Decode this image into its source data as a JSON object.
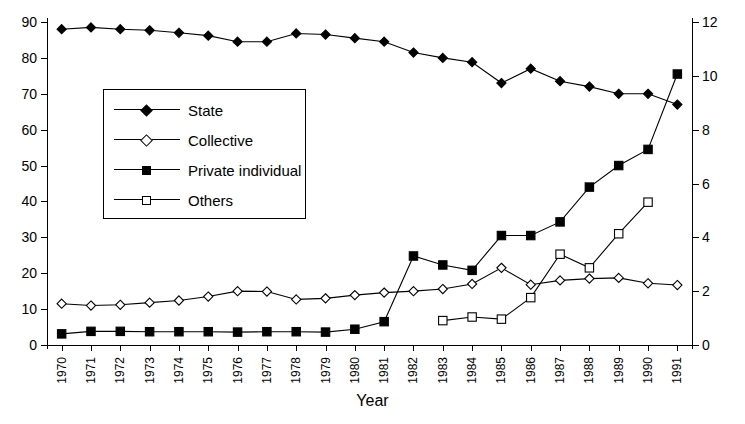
{
  "chart_data": {
    "type": "line",
    "title": "",
    "xlabel": "Year",
    "ylabel": "",
    "ylabel_right": "",
    "grid": false,
    "legend_position": "upper-left-inset",
    "x": [
      1970,
      1971,
      1972,
      1973,
      1974,
      1975,
      1976,
      1977,
      1978,
      1979,
      1980,
      1981,
      1982,
      1983,
      1984,
      1985,
      1986,
      1987,
      1988,
      1989,
      1990,
      1991
    ],
    "categories": [
      "1970",
      "1971",
      "1972",
      "1973",
      "1974",
      "1975",
      "1976",
      "1977",
      "1978",
      "1979",
      "1980",
      "1981",
      "1982",
      "1983",
      "1984",
      "1985",
      "1986",
      "1987",
      "1988",
      "1989",
      "1990",
      "1991"
    ],
    "ylim": [
      0,
      90
    ],
    "yticks": [
      0,
      10,
      20,
      30,
      40,
      50,
      60,
      70,
      80,
      90
    ],
    "ylim_right": [
      0,
      12
    ],
    "yticks_right": [
      0,
      2,
      4,
      6,
      8,
      10,
      12
    ],
    "series": [
      {
        "name": "State",
        "marker": "diamond-filled",
        "axis": "left",
        "values": [
          88.0,
          88.5,
          88.0,
          87.7,
          87.0,
          86.2,
          84.5,
          84.5,
          86.8,
          86.5,
          85.5,
          84.5,
          81.5,
          80.0,
          78.8,
          73.0,
          77.0,
          73.5,
          72.0,
          70.0,
          70.0,
          67.0
        ]
      },
      {
        "name": "Collective",
        "marker": "diamond-open",
        "axis": "left",
        "values": [
          11.5,
          11.0,
          11.2,
          11.8,
          12.4,
          13.5,
          15.0,
          14.9,
          12.7,
          13.0,
          13.9,
          14.6,
          15.0,
          15.6,
          17.0,
          21.5,
          16.8,
          18.0,
          18.5,
          18.7,
          17.2,
          16.7
        ]
      },
      {
        "name": "Private individual",
        "marker": "square-filled",
        "axis": "left",
        "values": [
          3.1,
          3.8,
          3.8,
          3.7,
          3.7,
          3.7,
          3.6,
          3.7,
          3.7,
          3.6,
          4.4,
          6.5,
          24.8,
          22.3,
          20.8,
          30.5,
          30.5,
          34.3,
          44.0,
          50.0,
          54.5,
          75.5
        ]
      },
      {
        "name": "Others",
        "marker": "square-open",
        "axis": "left",
        "values": [
          null,
          null,
          null,
          null,
          null,
          null,
          null,
          null,
          null,
          null,
          null,
          null,
          null,
          6.8,
          7.8,
          7.2,
          13.2,
          25.3,
          21.5,
          31.0,
          39.8,
          null
        ]
      }
    ]
  },
  "legend": {
    "items": [
      {
        "label": "State",
        "marker": "diamond-filled"
      },
      {
        "label": "Collective",
        "marker": "diamond-open"
      },
      {
        "label": "Private individual",
        "marker": "square-filled"
      },
      {
        "label": "Others",
        "marker": "square-open"
      }
    ]
  },
  "colors": {
    "line": "#000000",
    "background": "#ffffff",
    "axis": "#000000"
  }
}
